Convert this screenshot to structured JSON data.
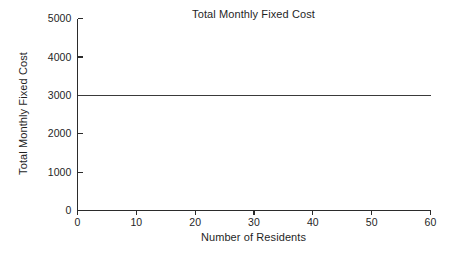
{
  "chart_data": {
    "type": "line",
    "title": "Total Monthly Fixed Cost",
    "xlabel": "Number of Residents",
    "ylabel": "Total Monthly Fixed Cost",
    "x": [
      0,
      60
    ],
    "series": [
      {
        "name": "Total Monthly Fixed Cost",
        "values": [
          3000,
          3000
        ],
        "color": "#3a3a3a"
      }
    ],
    "xlim": [
      0,
      60
    ],
    "ylim": [
      0,
      5000
    ],
    "xticks": [
      0,
      10,
      20,
      30,
      40,
      50,
      60
    ],
    "yticks": [
      0,
      1000,
      2000,
      3000,
      4000,
      5000
    ],
    "xticklabels": [
      "0",
      "10",
      "20",
      "30",
      "40",
      "50",
      "60"
    ],
    "yticklabels": [
      "0",
      "1000",
      "2000",
      "3000",
      "4000",
      "5000"
    ],
    "grid": false,
    "legend": false,
    "legend_position": "none",
    "annotations": [],
    "background_color": "#ffffff",
    "axis_color": "#2b2b2b"
  }
}
